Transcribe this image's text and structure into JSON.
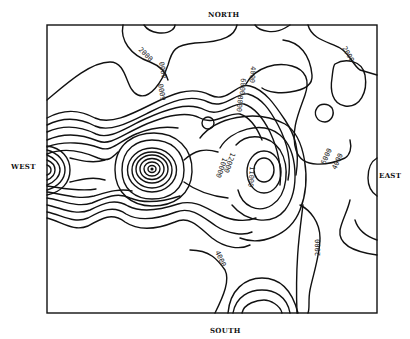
{
  "map": {
    "type": "contour-map",
    "directions": {
      "north": "NORTH",
      "south": "SOUTH",
      "west": "WEST",
      "east": "EAST"
    },
    "contour_labels": [
      {
        "id": "nw-2000",
        "text": "2000"
      },
      {
        "id": "ne-2000",
        "text": "2000"
      },
      {
        "id": "n-4000",
        "text": "4000"
      },
      {
        "id": "n-6000",
        "text": "6000"
      },
      {
        "id": "n-4000b",
        "text": "4000"
      },
      {
        "id": "n-6000b",
        "text": "6000"
      },
      {
        "id": "n-8000",
        "text": "8000"
      },
      {
        "id": "c-12000",
        "text": "12000"
      },
      {
        "id": "c-10000",
        "text": "10000"
      },
      {
        "id": "e-11000",
        "text": "11000"
      },
      {
        "id": "e-6000",
        "text": "6000"
      },
      {
        "id": "e-4000",
        "text": "4000"
      },
      {
        "id": "s-4000",
        "text": "4000"
      },
      {
        "id": "se-2000",
        "text": "2000"
      }
    ],
    "peaks": [
      {
        "name": "central-peak",
        "marker": "dot"
      },
      {
        "name": "west-edge-peak"
      },
      {
        "name": "east-peak",
        "value_label": "11000"
      }
    ]
  }
}
